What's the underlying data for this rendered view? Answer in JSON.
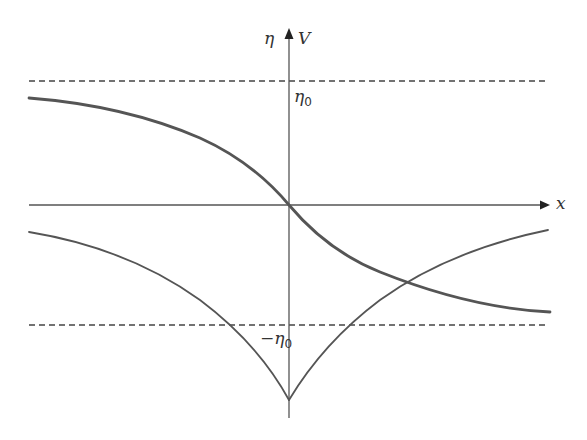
{
  "diagram": {
    "axes": {
      "x_label": "x",
      "y_label_left": "η",
      "y_label_right": "V"
    },
    "levels": {
      "upper_label": "η",
      "upper_sub": "0",
      "lower_label": "−η",
      "lower_sub": "0"
    },
    "colors": {
      "curve": "#555555",
      "axis": "#444444",
      "dashed": "#444444"
    },
    "curves": [
      {
        "name": "eta-profile",
        "description": "thick decreasing curve from +η0 asymptote to −η0 asymptote through origin"
      },
      {
        "name": "potential-V",
        "description": "V-shaped potential with cusp at origin, approaching axis at ±∞"
      }
    ]
  }
}
